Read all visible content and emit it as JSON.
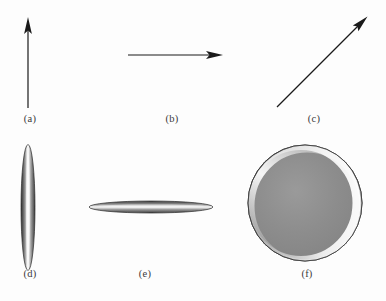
{
  "figure": {
    "background_color": "#fdfdfd",
    "ink_color": "#1a1a1a",
    "label_color": "#3a3a3a",
    "width": 386,
    "height": 301,
    "panels": [
      {
        "id": "a",
        "label": "(a)",
        "kind": "arrow",
        "description": "vertical arrow pointing up",
        "start": [
          28,
          108
        ],
        "end": [
          28,
          18
        ],
        "angle_deg": 90,
        "length_px": 90
      },
      {
        "id": "b",
        "label": "(b)",
        "kind": "arrow",
        "description": "horizontal arrow pointing right",
        "start": [
          128,
          55
        ],
        "end": [
          222,
          55
        ],
        "angle_deg": 0,
        "length_px": 94
      },
      {
        "id": "c",
        "label": "(c)",
        "kind": "arrow",
        "description": "diagonal arrow pointing up-right",
        "start": [
          277,
          107
        ],
        "end": [
          367,
          17
        ],
        "angle_deg": 45,
        "length_px": 127
      },
      {
        "id": "d",
        "label": "(d)",
        "kind": "ellipsoid",
        "description": "shaded prolate ellipsoid seen edge-on, long axis vertical",
        "center": [
          28,
          207
        ],
        "semi_axis_x_px": 7,
        "semi_axis_y_px": 63,
        "orientation_deg": 90,
        "fill_color": "#7d7d7d",
        "highlight_color": "#fbfbfb",
        "edge_color": "#2d2d2d"
      },
      {
        "id": "e",
        "label": "(e)",
        "kind": "ellipsoid",
        "description": "shaded oblate disc seen edge-on, long axis horizontal",
        "center": [
          151,
          207
        ],
        "semi_axis_x_px": 62,
        "semi_axis_y_px": 6,
        "orientation_deg": 0,
        "fill_color": "#7d7d7d",
        "highlight_color": "#fbfbfb",
        "edge_color": "#2d2d2d"
      },
      {
        "id": "f",
        "label": "(f)",
        "kind": "ellipsoid",
        "description": "shaded sphere / disc seen face-on",
        "center": [
          305,
          203
        ],
        "semi_axis_x_px": 57,
        "semi_axis_y_px": 58,
        "orientation_deg": 0,
        "fill_color": "#8b8b8b",
        "highlight_color": "#fdfdfd",
        "edge_color": "#2d2d2d"
      }
    ]
  }
}
